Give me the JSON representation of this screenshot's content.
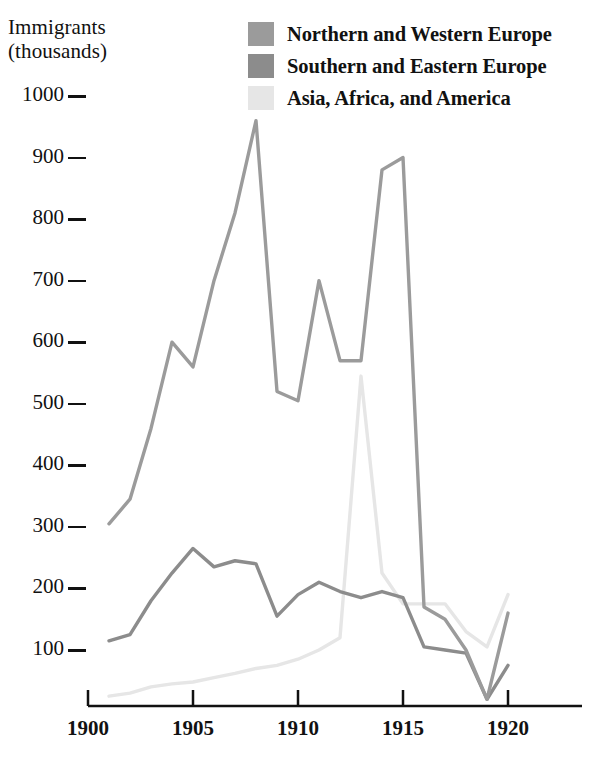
{
  "axis_title": "Immigrants\n(thousands)",
  "legend": {
    "items": [
      {
        "label": "Northern and Western Europe",
        "color": "#9b9b9b",
        "key": "northern_western_europe"
      },
      {
        "label": "Southern and Eastern Europe",
        "color": "#8c8c8c",
        "key": "southern_eastern_europe"
      },
      {
        "label": "Asia, Africa, and America",
        "color": "#e6e6e6",
        "key": "asia_africa_america"
      }
    ]
  },
  "chart_data": {
    "type": "line",
    "title": "",
    "xlabel": "",
    "ylabel": "Immigrants (thousands)",
    "xlim": [
      1900,
      1923.5
    ],
    "ylim": [
      0,
      1010
    ],
    "xticks": [
      1900,
      1905,
      1910,
      1915,
      1920
    ],
    "yticks": [
      100,
      200,
      300,
      400,
      500,
      600,
      700,
      800,
      900,
      1000
    ],
    "grid": false,
    "legend_position": "top-right",
    "x": [
      1901,
      1902,
      1903,
      1904,
      1905,
      1906,
      1907,
      1908,
      1909,
      1910,
      1911,
      1912,
      1913,
      1914,
      1915,
      1916,
      1917,
      1918,
      1919,
      1920
    ],
    "series": [
      {
        "name": "Northern and Western Europe",
        "color": "#9b9b9b",
        "values": [
          305,
          345,
          460,
          600,
          560,
          700,
          810,
          960,
          520,
          505,
          700,
          570,
          570,
          880,
          900,
          170,
          150,
          100,
          20,
          160
        ]
      },
      {
        "name": "Southern and Eastern Europe",
        "color": "#8c8c8c",
        "values": [
          115,
          125,
          180,
          225,
          265,
          235,
          245,
          240,
          155,
          190,
          210,
          195,
          185,
          195,
          185,
          105,
          100,
          95,
          20,
          75
        ]
      },
      {
        "name": "Asia, Africa, and America",
        "color": "#e6e6e6",
        "values": [
          25,
          30,
          40,
          45,
          48,
          55,
          62,
          70,
          75,
          85,
          100,
          120,
          545,
          225,
          175,
          175,
          175,
          130,
          105,
          190
        ]
      }
    ]
  },
  "geometry": {
    "plot_left": 88,
    "plot_right": 582,
    "axis_baseline_y": 706,
    "y_value_100": 650,
    "y_value_1000": 96,
    "x_year_1900": 88,
    "x_per_year": 21.0
  }
}
